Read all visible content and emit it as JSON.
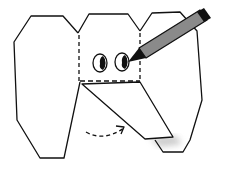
{
  "diagram": {
    "colors": {
      "background": "#ffffff",
      "outline": "#111111",
      "pencil_body": "#8a8a8a",
      "pencil_tip": "#111111",
      "shadow": "#bdbdbd"
    },
    "parts": [
      {
        "id": "left-ear",
        "label": "left ear"
      },
      {
        "id": "head",
        "label": "head panel (dashed fold lines)"
      },
      {
        "id": "right-ear",
        "label": "right ear"
      },
      {
        "id": "trunk",
        "label": "trunk flap folded down"
      },
      {
        "id": "eyes",
        "label": "two eyes"
      },
      {
        "id": "fold-arrow",
        "label": "curved dashed fold arrow"
      },
      {
        "id": "pencil",
        "label": "pencil drawing the eyes"
      }
    ]
  }
}
